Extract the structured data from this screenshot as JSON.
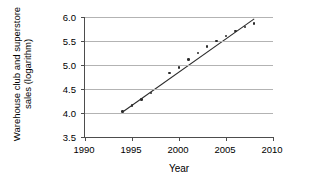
{
  "chart_data": {
    "type": "scatter",
    "title": "",
    "xlabel": "Year",
    "ylabel_line1": "Warehouse club and superstore",
    "ylabel_line2": "sales (logarithm)",
    "ylabel": "Warehouse club and superstore sales (logarithm)",
    "xlim": [
      1990,
      2010
    ],
    "ylim": [
      3.5,
      6.0
    ],
    "xticks": [
      1990,
      1995,
      2000,
      2005,
      2010
    ],
    "xtick_labels": [
      "1990",
      "1995",
      "2000",
      "2005",
      "2010"
    ],
    "yticks": [
      3.5,
      4.0,
      4.5,
      5.0,
      5.5,
      6.0
    ],
    "ytick_labels": [
      "3.5",
      "4.0",
      "4.5",
      "5.0",
      "5.5",
      "6.0"
    ],
    "grid": "horizontal",
    "legend": "none",
    "point_color": "#2b2b2b",
    "line_color": "#2b2b2b",
    "grid_color": "#b3b3b3",
    "axis_color": "#4d4d4d",
    "x": [
      1994,
      1995,
      1996,
      1997,
      1999,
      2000,
      2001,
      2002,
      2003,
      2004,
      2005,
      2006,
      2007,
      2008
    ],
    "y": [
      4.03,
      4.16,
      4.28,
      4.42,
      4.83,
      4.95,
      5.11,
      5.25,
      5.39,
      5.5,
      5.6,
      5.71,
      5.79,
      5.87
    ],
    "points": [
      {
        "x": 1994,
        "y": 4.03
      },
      {
        "x": 1995,
        "y": 4.16
      },
      {
        "x": 1996,
        "y": 4.28
      },
      {
        "x": 1997,
        "y": 4.42
      },
      {
        "x": 1999,
        "y": 4.83
      },
      {
        "x": 2000,
        "y": 4.95
      },
      {
        "x": 2001,
        "y": 5.11
      },
      {
        "x": 2002,
        "y": 5.25
      },
      {
        "x": 2003,
        "y": 5.39
      },
      {
        "x": 2004,
        "y": 5.5
      },
      {
        "x": 2005,
        "y": 5.6
      },
      {
        "x": 2006,
        "y": 5.71
      },
      {
        "x": 2007,
        "y": 5.79
      },
      {
        "x": 2008,
        "y": 5.87
      }
    ],
    "trendline": {
      "type": "linear-fit",
      "x_start": 1994,
      "y_start": 4.02,
      "x_end": 2008,
      "y_end": 5.96
    }
  }
}
